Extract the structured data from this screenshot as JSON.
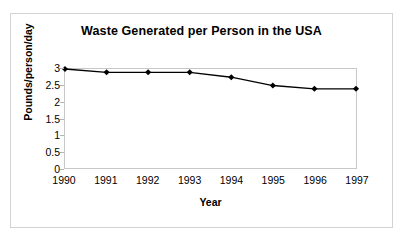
{
  "chart_data": {
    "type": "line",
    "title": "Waste Generated per Person in the USA",
    "xlabel": "Year",
    "ylabel": "Pounds/person/day",
    "categories": [
      "1990",
      "1991",
      "1992",
      "1993",
      "1994",
      "1995",
      "1996",
      "1997"
    ],
    "values": [
      3,
      2.9,
      2.9,
      2.9,
      2.75,
      2.5,
      2.4,
      2.4
    ],
    "series": [
      {
        "name": "Waste per person",
        "values": [
          3,
          2.9,
          2.9,
          2.9,
          2.75,
          2.5,
          2.4,
          2.4
        ]
      }
    ],
    "ylim": [
      0,
      3
    ],
    "yticks": [
      "0",
      "0.5",
      "1",
      "1.5",
      "2",
      "2.5",
      "3"
    ],
    "ytick_values": [
      0,
      0.5,
      1,
      1.5,
      2,
      2.5,
      3
    ],
    "grid": false,
    "legend": "none",
    "marker": "diamond",
    "line_color": "#000000",
    "marker_color": "#000000",
    "plot_border_color": "#c8c8c8",
    "frame_border_color": "#d2d2d2",
    "background_color": "#ffffff",
    "text_color": "#000000"
  }
}
